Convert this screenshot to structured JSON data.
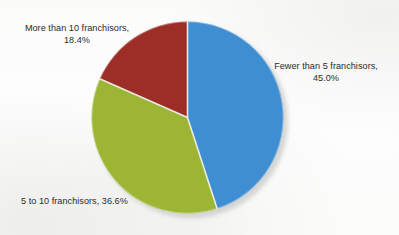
{
  "chart_data": {
    "type": "pie",
    "title": "",
    "subtitle": "",
    "xlabel": "",
    "ylabel": "",
    "grid": false,
    "legend_position": "none",
    "labels_position": "outside",
    "start_angle_deg": 0,
    "direction": "clockwise",
    "units": "percent",
    "total": 100.0,
    "categories": [
      "Fewer than 5 franchisors",
      "5 to 10 franchisors",
      "More than 10 franchisors"
    ],
    "values": [
      45.0,
      36.6,
      18.4
    ],
    "value_labels": [
      "45.0%",
      "36.6%",
      "18.4%"
    ],
    "colors": [
      "#3f8ed2",
      "#9cb535",
      "#9d2e27"
    ],
    "slices": [
      {
        "name": "Fewer than 5 franchisors",
        "value": 45.0,
        "value_label": "45.0%",
        "color": "#3f8ed2",
        "label_line1": "Fewer than 5 franchisors,",
        "label_line2": "45.0%",
        "label_text": "Fewer than 5 franchisors, 45.0%",
        "start_deg": 0,
        "end_deg": 162.0
      },
      {
        "name": "5 to 10 franchisors",
        "value": 36.6,
        "value_label": "36.6%",
        "color": "#9cb535",
        "label_line1": "5 to 10 franchisors, 36.6%",
        "label_line2": "",
        "label_text": "5 to 10 franchisors, 36.6%",
        "start_deg": 162.0,
        "end_deg": 293.76
      },
      {
        "name": "More than 10 franchisors",
        "value": 18.4,
        "value_label": "18.4%",
        "color": "#9d2e27",
        "label_line1": "More than 10 franchisors,",
        "label_line2": "18.4%",
        "label_text": "More than 10 franchisors, 18.4%",
        "start_deg": 293.76,
        "end_deg": 360.0
      }
    ]
  },
  "appearance": {
    "background_color": "#fdfdfc",
    "text_color": "#2b2b2b",
    "slice_separator_color": "#f2f0ea",
    "shadow_color": "#c9c9c7"
  }
}
